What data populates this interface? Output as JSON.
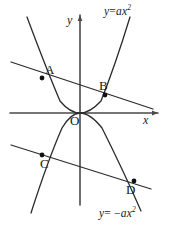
{
  "figure": {
    "width": 170,
    "height": 226,
    "background": "#ffffff",
    "stroke_color": "#2b2b2b",
    "axis_color": "#4a4a4a",
    "point_color": "#111111"
  },
  "axes": {
    "x_label": "x",
    "y_label": "y",
    "origin_label": "O",
    "x_axis": {
      "x1": 10,
      "y1": 113,
      "x2": 158,
      "y2": 113
    },
    "y_axis": {
      "x1": 80,
      "y1": 15,
      "x2": 80,
      "y2": 205
    },
    "origin": {
      "x": 80,
      "y": 113
    }
  },
  "equations": {
    "upper": {
      "lhs": "y",
      "op": "=",
      "rhs_base": "ax",
      "rhs_exp": "2",
      "text": "y = ax2"
    },
    "lower": {
      "lhs": "y",
      "op": "= −",
      "rhs_base": "ax",
      "rhs_exp": "2",
      "text": "y = -ax2"
    }
  },
  "points": [
    {
      "name": "A",
      "label": "A",
      "x": 42,
      "y": 78,
      "label_x": 45,
      "label_y": 63
    },
    {
      "name": "B",
      "label": "B",
      "x": 105,
      "y": 95,
      "label_x": 99,
      "label_y": 79
    },
    {
      "name": "C",
      "label": "C",
      "x": 42,
      "y": 155,
      "label_x": 40,
      "label_y": 157
    },
    {
      "name": "D",
      "label": "D",
      "x": 134,
      "y": 181,
      "label_x": 126,
      "label_y": 183
    }
  ],
  "lines": [
    {
      "name": "line-AB",
      "x1": 11,
      "y1": 62,
      "x2": 153,
      "y2": 109
    },
    {
      "name": "line-CD",
      "x1": 11,
      "y1": 145,
      "x2": 151,
      "y2": 189
    }
  ],
  "curves": [
    {
      "name": "parabola-up",
      "equation": "y = ax2",
      "path": "M 27,17 Q 46,68 60,101 Q 70,113 80,113 Q 90,113 101,101 Q 115,66 130,17"
    },
    {
      "name": "parabola-down",
      "equation": "y = -ax2",
      "path": "M 31,213 Q 48,160 62,128 Q 71,113 80,113 Q 90,113 102,128 Q 124,172 141,211"
    }
  ],
  "label_positions": {
    "eq_upper": {
      "x": 104,
      "y": 6
    },
    "eq_lower": {
      "x": 99,
      "y": 208
    },
    "x_axis_label": {
      "x": 143,
      "y": 114
    },
    "y_axis_label": {
      "x": 67,
      "y": 14
    },
    "origin_label": {
      "x": 70,
      "y": 114
    }
  }
}
